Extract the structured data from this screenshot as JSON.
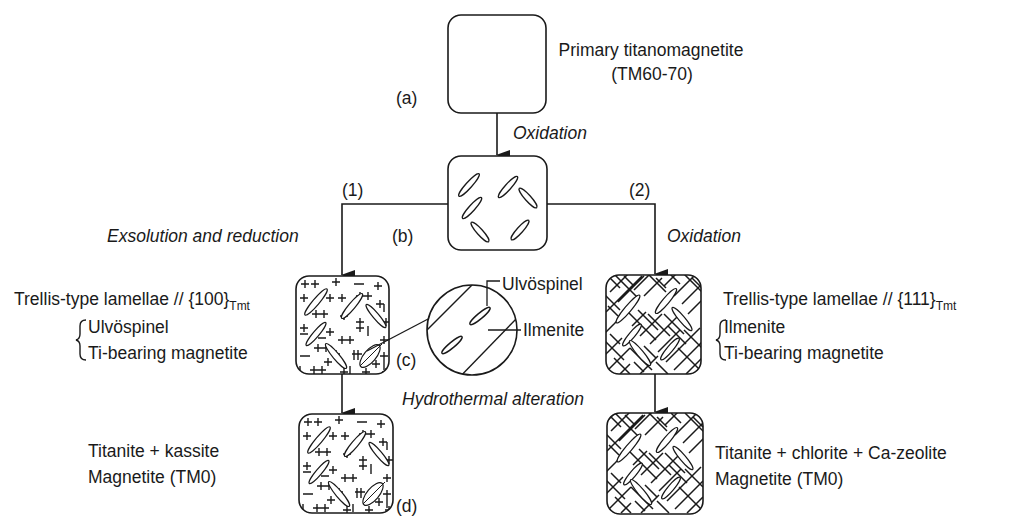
{
  "diagram": {
    "stages": {
      "a": {
        "marker": "(a)",
        "title": "Primary titanomagnetite",
        "subtitle": "(TM60-70)"
      },
      "b": {
        "marker": "(b)"
      },
      "c": {
        "marker": "(c)"
      },
      "d": {
        "marker": "(d)"
      }
    },
    "processes": {
      "a_to_b": "Oxidation",
      "path1_label": "(1)",
      "path1_process": "Exsolution and reduction",
      "path2_label": "(2)",
      "path2_process": "Oxidation",
      "hydrothermal": "Hydrothermal alteration"
    },
    "left_branch": {
      "lamellae_title": "Trellis-type lamellae // {100}",
      "lamellae_sub": "Tmt",
      "phases": [
        "Ulvöspinel",
        "Ti-bearing magnetite"
      ],
      "final_products": [
        "Titanite + kassite",
        "Magnetite (TM0)"
      ]
    },
    "right_branch": {
      "lamellae_title": "Trellis-type lamellae // {111}",
      "lamellae_sub": "Tmt",
      "phases": [
        "Ilmenite",
        "Ti-bearing magnetite"
      ],
      "final_products": [
        "Titanite + chlorite + Ca-zeolite",
        "Magnetite (TM0)"
      ]
    },
    "inset": {
      "labels": [
        "Ulvöspinel",
        "Ilmenite"
      ]
    },
    "colors": {
      "ink": "#1a1a1a",
      "background": "#ffffff"
    }
  }
}
